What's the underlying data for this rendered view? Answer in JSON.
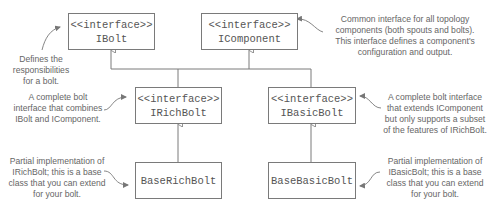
{
  "diagram": {
    "nodes": [
      {
        "id": "ibolt",
        "stereotype": "<<interface>>",
        "name": "IBolt"
      },
      {
        "id": "icomponent",
        "stereotype": "<<interface>>",
        "name": "IComponent"
      },
      {
        "id": "irichbolt",
        "stereotype": "<<interface>>",
        "name": "IRichBolt"
      },
      {
        "id": "ibasicbolt",
        "stereotype": "<<interface>>",
        "name": "IBasicBolt"
      },
      {
        "id": "baserichbolt",
        "name": "BaseRichBolt"
      },
      {
        "id": "basebasicbolt",
        "name": "BaseBasicBolt"
      }
    ],
    "edges": [
      {
        "from": "irichbolt",
        "to": "ibolt",
        "type": "inheritance"
      },
      {
        "from": "irichbolt",
        "to": "icomponent",
        "type": "inheritance"
      },
      {
        "from": "ibasicbolt",
        "to": "icomponent",
        "type": "inheritance"
      },
      {
        "from": "baserichbolt",
        "to": "irichbolt",
        "type": "inheritance"
      },
      {
        "from": "basebasicbolt",
        "to": "ibasicbolt",
        "type": "inheritance"
      }
    ],
    "annotations": {
      "ibolt": [
        "Defines the",
        "responsibilities",
        "for a bolt."
      ],
      "icomponent": [
        "Common interface for all topology",
        "components (both spouts and bolts).",
        "This interface defines a component's",
        "configuration and output."
      ],
      "irichbolt": [
        "A complete bolt",
        "interface that combines",
        "IBolt and IComponent."
      ],
      "ibasicbolt": [
        "A complete bolt interface",
        "that extends IComponent",
        "but only supports a subset",
        "of the features of IRichBolt."
      ],
      "baserichbolt": [
        "Partial implementation of",
        "IRichBolt; this is a base",
        "class that you can extend",
        "for your bolt."
      ],
      "basebasicbolt": [
        "Partial implementation of",
        "IBasicBolt; this is a base",
        "class that you can extend",
        "for your bolt."
      ]
    },
    "colors": {
      "line": "#7a7a7a",
      "text": "#555555",
      "note": "#666666"
    }
  }
}
